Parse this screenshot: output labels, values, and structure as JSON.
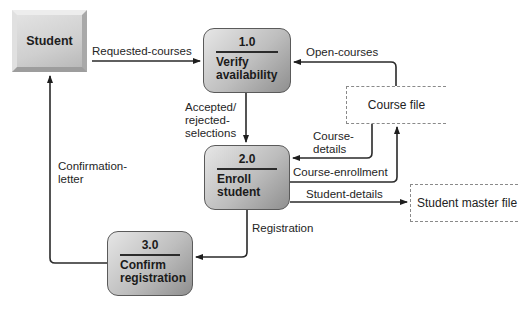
{
  "external_entities": [
    {
      "id": "student",
      "label": "Student"
    }
  ],
  "processes": [
    {
      "id": "p1",
      "number": "1.0",
      "name_line1": "Verify",
      "name_line2": "availability"
    },
    {
      "id": "p2",
      "number": "2.0",
      "name_line1": "Enroll",
      "name_line2": "student"
    },
    {
      "id": "p3",
      "number": "3.0",
      "name_line1": "Confirm",
      "name_line2": "registration"
    }
  ],
  "data_stores": [
    {
      "id": "course_file",
      "label": "Course file"
    },
    {
      "id": "student_master_file",
      "label": "Student master file"
    }
  ],
  "data_flows": {
    "requested_courses": {
      "from": "Student",
      "to": "1.0",
      "label": "Requested-courses"
    },
    "open_courses": {
      "from": "Course file",
      "to": "1.0",
      "label": "Open-courses"
    },
    "accepted_rejected": {
      "from": "1.0",
      "to": "2.0",
      "line1": "Accepted/",
      "line2": "rejected-",
      "line3": "selections"
    },
    "course_details": {
      "from": "Course file",
      "to": "2.0",
      "line1": "Course-",
      "line2": "details"
    },
    "course_enrollment": {
      "from": "2.0",
      "to": "Course file",
      "label": "Course-enrollment"
    },
    "student_details": {
      "from": "2.0",
      "to": "Student master file",
      "label": "Student-details"
    },
    "registration": {
      "from": "2.0",
      "to": "3.0",
      "label": "Registration"
    },
    "confirmation_letter": {
      "from": "3.0",
      "to": "Student",
      "line1": "Confirmation-",
      "line2": "letter"
    }
  }
}
